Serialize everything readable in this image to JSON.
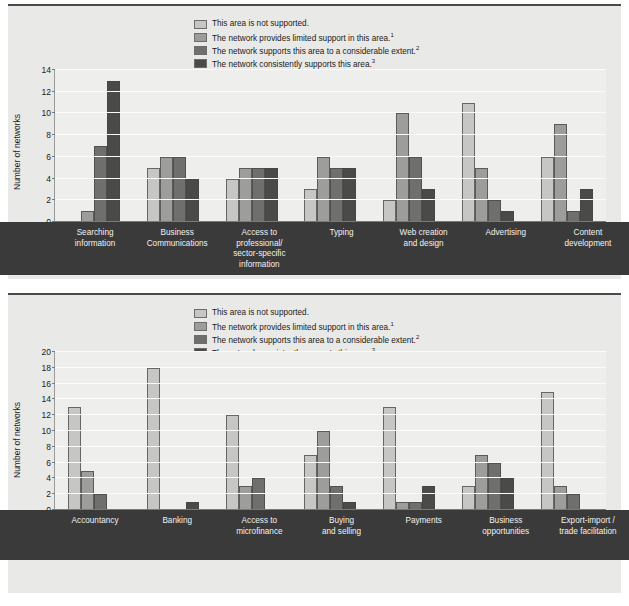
{
  "legend": {
    "items": [
      {
        "label": "This area is not supported.",
        "sup": "",
        "color": "#c6c6c4"
      },
      {
        "label": "The network provides limited support in this area.",
        "sup": "1",
        "color": "#9d9d9b"
      },
      {
        "label": "The network supports this area to a considerable extent.",
        "sup": "2",
        "color": "#6f6f6d"
      },
      {
        "label": "The network consistently supports this area.",
        "sup": "3",
        "color": "#4a4a48"
      }
    ]
  },
  "chart_data": [
    {
      "type": "bar",
      "title": "",
      "xlabel": "",
      "ylabel": "Number of networks",
      "ylim": [
        0,
        14
      ],
      "yticks": [
        0,
        2,
        4,
        6,
        8,
        10,
        12,
        14
      ],
      "grid": true,
      "legend_position": "top-center",
      "categories": [
        "Searching information",
        "Business Communications",
        "Access to professional/ sector-specific information",
        "Typing",
        "Web creation and design",
        "Advertising",
        "Content development"
      ],
      "category_lines": [
        [
          "Searching",
          "information"
        ],
        [
          "Business",
          "Communications"
        ],
        [
          "Access to",
          "professional/",
          "sector-specific",
          "information"
        ],
        [
          "Typing"
        ],
        [
          "Web creation",
          "and design"
        ],
        [
          "Advertising"
        ],
        [
          "Content",
          "development"
        ]
      ],
      "series": [
        {
          "name": "This area is not supported.",
          "values": [
            0,
            5,
            4,
            3,
            2,
            11,
            6
          ]
        },
        {
          "name": "The network provides limited support in this area.",
          "values": [
            1,
            6,
            5,
            6,
            10,
            5,
            9
          ]
        },
        {
          "name": "The network supports this area to a considerable extent.",
          "values": [
            7,
            6,
            5,
            5,
            6,
            2,
            1
          ]
        },
        {
          "name": "The network consistently supports this area.",
          "values": [
            13,
            4,
            5,
            5,
            3,
            1,
            3
          ]
        }
      ]
    },
    {
      "type": "bar",
      "title": "",
      "xlabel": "",
      "ylabel": "Number of networks",
      "ylim": [
        0,
        20
      ],
      "yticks": [
        0,
        2,
        4,
        6,
        8,
        10,
        12,
        14,
        16,
        18,
        20
      ],
      "grid": true,
      "legend_position": "top-center",
      "categories": [
        "Accountancy",
        "Banking",
        "Access to microfinance",
        "Buying and selling",
        "Payments",
        "Business opportunities",
        "Export-import / trade facilitation"
      ],
      "category_lines": [
        [
          "Accountancy"
        ],
        [
          "Banking"
        ],
        [
          "Access to",
          "microfinance"
        ],
        [
          "Buying",
          "and selling"
        ],
        [
          "Payments"
        ],
        [
          "Business",
          "opportunities"
        ],
        [
          "Export-import /",
          "trade facilitation"
        ]
      ],
      "series": [
        {
          "name": "This area is not supported.",
          "values": [
            13,
            18,
            12,
            7,
            13,
            3,
            15
          ]
        },
        {
          "name": "The network provides limited support in this area.",
          "values": [
            5,
            0,
            3,
            10,
            1,
            7,
            3
          ]
        },
        {
          "name": "The network supports this area to a considerable extent.",
          "values": [
            2,
            0,
            4,
            3,
            1,
            6,
            2
          ]
        },
        {
          "name": "The network consistently supports this area.",
          "values": [
            0,
            1,
            0,
            1,
            3,
            4,
            0
          ]
        }
      ]
    }
  ]
}
